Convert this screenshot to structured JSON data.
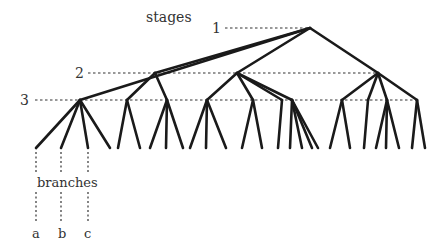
{
  "title": "stages",
  "stage_labels": [
    "1",
    "2",
    "3"
  ],
  "branches_label": "branches",
  "branch_letters": [
    "a",
    "b",
    "c"
  ],
  "colors": {
    "edge": "#1a1a1a",
    "dash": "#333333",
    "text": "#333333"
  },
  "tree": {
    "root": {
      "x": 310,
      "y": 28
    },
    "stage2": [
      {
        "x": 155,
        "y": 73
      },
      {
        "x": 237,
        "y": 73
      },
      {
        "x": 378,
        "y": 73
      }
    ],
    "stage3": [
      {
        "x": 80,
        "y": 100,
        "parent": "root",
        "leaves": [
          36,
          62,
          88,
          112
        ]
      },
      {
        "x": 127,
        "y": 100,
        "parent": 0,
        "leaves": [
          120,
          140
        ]
      },
      {
        "x": 167,
        "y": 100,
        "parent": 0,
        "leaves": [
          150,
          166,
          183
        ]
      },
      {
        "x": 207,
        "y": 100,
        "parent": 1,
        "leaves": [
          190,
          206,
          226
        ]
      },
      {
        "x": 253,
        "y": 100,
        "parent": 1,
        "leaves": [
          238,
          262
        ]
      },
      {
        "x": 282,
        "y": 100,
        "parent": 1,
        "leaves": [
          250,
          268
        ]
      },
      {
        "x": 292,
        "y": 100,
        "parent": 1,
        "leaves": [
          276,
          292,
          305,
          314
        ]
      },
      {
        "x": 342,
        "y": 100,
        "parent": 2,
        "leaves": [
          330,
          350
        ]
      },
      {
        "x": 368,
        "y": 100,
        "parent": 2,
        "leaves": [
          358
        ]
      },
      {
        "x": 387,
        "y": 100,
        "parent": 2,
        "leaves": [
          375,
          384,
          398
        ]
      },
      {
        "x": 417,
        "y": 100,
        "parent": 2,
        "leaves": [
          410,
          424
        ]
      }
    ],
    "leaf_y": 148
  }
}
